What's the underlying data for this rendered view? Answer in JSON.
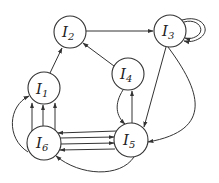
{
  "diagram": {
    "type": "directed-graph",
    "nodes": [
      {
        "id": "I1",
        "label": "I",
        "sub": "1",
        "x": 44,
        "y": 88,
        "r": 16
      },
      {
        "id": "I2",
        "label": "I",
        "sub": "2",
        "x": 70,
        "y": 32,
        "r": 16
      },
      {
        "id": "I3",
        "label": "I",
        "sub": "3",
        "x": 170,
        "y": 31,
        "r": 16
      },
      {
        "id": "I4",
        "label": "I",
        "sub": "4",
        "x": 128,
        "y": 74,
        "r": 16
      },
      {
        "id": "I5",
        "label": "I",
        "sub": "5",
        "x": 131,
        "y": 140,
        "r": 17
      },
      {
        "id": "I6",
        "label": "I",
        "sub": "6",
        "x": 44,
        "y": 143,
        "r": 17
      }
    ],
    "edges": [
      {
        "from": "I1",
        "to": "I2",
        "count": 1
      },
      {
        "from": "I2",
        "to": "I3",
        "count": 1
      },
      {
        "from": "I3",
        "to": "I3",
        "count": 2,
        "kind": "self-loop"
      },
      {
        "from": "I4",
        "to": "I2",
        "count": 1
      },
      {
        "from": "I3",
        "to": "I5",
        "count": 2
      },
      {
        "from": "I4",
        "to": "I5",
        "count": 1
      },
      {
        "from": "I5",
        "to": "I4",
        "count": 1
      },
      {
        "from": "I6",
        "to": "I1",
        "count": 4
      },
      {
        "from": "I6",
        "to": "I5",
        "count": 2
      },
      {
        "from": "I5",
        "to": "I6",
        "count": 3
      }
    ],
    "colors": {
      "stroke": "#333333",
      "background": "#ffffff"
    }
  }
}
